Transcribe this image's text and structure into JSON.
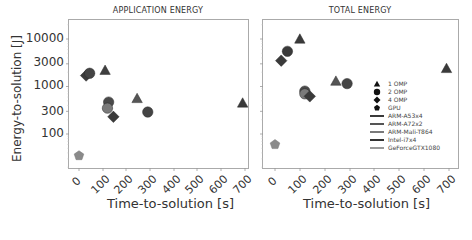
{
  "chart_data": [
    {
      "type": "scatter",
      "title": "APPLICATION ENERGY",
      "xlabel": "Time-to-solution   [s]",
      "ylabel": "Energy-to-solution   [J]",
      "xscale": "linear",
      "yscale": "log",
      "xlim": [
        -20,
        720
      ],
      "ylim": [
        20,
        20000
      ],
      "xticks": [
        0,
        100,
        200,
        300,
        400,
        500,
        600,
        700
      ],
      "yticks": [
        100,
        300,
        1000,
        3000,
        10000
      ],
      "grid": false,
      "points": [
        {
          "x": 0,
          "y": 35,
          "marker": "pentagon",
          "series": "GPU",
          "device": "GeForceGTX1080",
          "color": "#8a8a8a"
        },
        {
          "x": 30,
          "y": 1700,
          "marker": "diamond",
          "series": "4 OMP",
          "device": "ARM-A53x4",
          "color": "#3a3a3a"
        },
        {
          "x": 45,
          "y": 1900,
          "marker": "circle",
          "series": "2 OMP",
          "device": "ARM-A53x4",
          "color": "#444444"
        },
        {
          "x": 110,
          "y": 2200,
          "marker": "triangle",
          "series": "1 OMP",
          "device": "ARM-A53x4",
          "color": "#3f3f3f"
        },
        {
          "x": 125,
          "y": 470,
          "marker": "circle",
          "series": "2 OMP",
          "device": "Intel-i7x4",
          "color": "#4a4a4a"
        },
        {
          "x": 120,
          "y": 350,
          "marker": "circle",
          "series": "2 OMP",
          "device": "ARM-Mali-T864",
          "color": "#7a7a7a"
        },
        {
          "x": 145,
          "y": 230,
          "marker": "diamond",
          "series": "4 OMP",
          "device": "Intel-i7x4",
          "color": "#3a3a3a"
        },
        {
          "x": 245,
          "y": 560,
          "marker": "triangle",
          "series": "1 OMP",
          "device": "ARM-A72x2",
          "color": "#555555"
        },
        {
          "x": 290,
          "y": 290,
          "marker": "circle",
          "series": "2 OMP",
          "device": "ARM-A72x2",
          "color": "#444444"
        },
        {
          "x": 690,
          "y": 450,
          "marker": "triangle",
          "series": "1 OMP",
          "device": "ARM-A53x4",
          "color": "#3a3a3a"
        }
      ]
    },
    {
      "type": "scatter",
      "title": "TOTAL ENERGY",
      "xlabel": "Time-to-solution   [s]",
      "ylabel": "",
      "xscale": "linear",
      "yscale": "log",
      "xlim": [
        -20,
        720
      ],
      "ylim": [
        20,
        20000
      ],
      "xticks": [
        0,
        100,
        200,
        300,
        400,
        500,
        600,
        700
      ],
      "yticks": [
        100,
        300,
        1000,
        3000,
        10000
      ],
      "grid": false,
      "legend_position": "lower right",
      "points": [
        {
          "x": 0,
          "y": 60,
          "marker": "pentagon",
          "series": "GPU",
          "device": "GeForceGTX1080",
          "color": "#8a8a8a"
        },
        {
          "x": 25,
          "y": 3500,
          "marker": "diamond",
          "series": "4 OMP",
          "device": "ARM-A53x4",
          "color": "#3a3a3a"
        },
        {
          "x": 50,
          "y": 5500,
          "marker": "circle",
          "series": "2 OMP",
          "device": "ARM-A53x4",
          "color": "#3a3a3a"
        },
        {
          "x": 100,
          "y": 10000,
          "marker": "triangle",
          "series": "1 OMP",
          "device": "ARM-A53x4",
          "color": "#3a3a3a"
        },
        {
          "x": 120,
          "y": 800,
          "marker": "circle",
          "series": "2 OMP",
          "device": "Intel-i7x4",
          "color": "#4a4a4a"
        },
        {
          "x": 120,
          "y": 700,
          "marker": "circle",
          "series": "2 OMP",
          "device": "ARM-Mali-T864",
          "color": "#7a7a7a"
        },
        {
          "x": 140,
          "y": 620,
          "marker": "diamond",
          "series": "4 OMP",
          "device": "Intel-i7x4",
          "color": "#3a3a3a"
        },
        {
          "x": 245,
          "y": 1300,
          "marker": "triangle",
          "series": "1 OMP",
          "device": "ARM-A72x2",
          "color": "#555555"
        },
        {
          "x": 290,
          "y": 1150,
          "marker": "circle",
          "series": "2 OMP",
          "device": "ARM-A72x2",
          "color": "#444444"
        },
        {
          "x": 690,
          "y": 2400,
          "marker": "triangle",
          "series": "1 OMP",
          "device": "ARM-A53x4",
          "color": "#3a3a3a"
        }
      ]
    }
  ],
  "panels": {
    "left": {
      "title": "APPLICATION ENERGY",
      "xlabel": "Time-to-solution   [s]",
      "ylabel": "Energy-to-solution   [J]",
      "yticks": [
        "10000",
        "3000",
        "1000",
        "300",
        "100"
      ],
      "xticks": [
        "0",
        "100",
        "200",
        "300",
        "400",
        "500",
        "600",
        "700"
      ]
    },
    "right": {
      "title": "TOTAL ENERGY",
      "xlabel": "Time-to-solution   [s]",
      "xticks": [
        "0",
        "100",
        "200",
        "300",
        "400",
        "500",
        "600",
        "700"
      ]
    }
  },
  "legend": {
    "markers": [
      {
        "label": "1 OMP",
        "shape": "triangle"
      },
      {
        "label": "2 OMP",
        "shape": "circle"
      },
      {
        "label": "4 OMP",
        "shape": "diamond"
      },
      {
        "label": "GPU",
        "shape": "pentagon"
      }
    ],
    "devices": [
      {
        "label": "ARM-A53x4",
        "color": "#3a3a3a"
      },
      {
        "label": "ARM-A72x2",
        "color": "#555555"
      },
      {
        "label": "ARM-Mali-T864",
        "color": "#7a7a7a"
      },
      {
        "label": "Intel-i7x4",
        "color": "#333333"
      },
      {
        "label": "GeForceGTX1080",
        "color": "#9a9a9a"
      }
    ]
  }
}
